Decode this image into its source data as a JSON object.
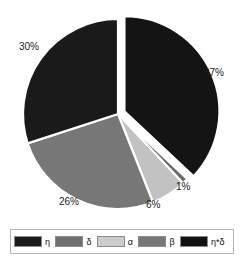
{
  "chart_data": {
    "type": "pie",
    "title": "",
    "categories": [
      "η",
      "β",
      "α",
      "δ",
      "η*δ"
    ],
    "values": [
      37,
      1,
      6,
      26,
      30
    ],
    "value_labels": [
      "37%",
      "1%",
      "6%",
      "26%",
      "30%"
    ],
    "units": "percent",
    "legend_position": "bottom",
    "start_angle_deg": 0,
    "direction": "clockwise",
    "exploded_slices": [
      "η"
    ],
    "slice_colors": [
      "#141414",
      "#6a6a6a",
      "#c2c2c2",
      "#777777",
      "#1a1a1a"
    ],
    "grid": false,
    "xlabel": "",
    "ylabel": ""
  },
  "pie": {
    "slices": [
      {
        "label": "η",
        "percent_text": "37%",
        "value": 37,
        "color": "#141414",
        "exploded": true
      },
      {
        "label": "β",
        "percent_text": "1%",
        "value": 1,
        "color": "#6a6a6a",
        "exploded": false
      },
      {
        "label": "α",
        "percent_text": "6%",
        "value": 6,
        "color": "#c2c2c2",
        "exploded": false
      },
      {
        "label": "δ",
        "percent_text": "26%",
        "value": 26,
        "color": "#777777",
        "exploded": false
      },
      {
        "label": "η*δ",
        "percent_text": "30%",
        "value": 30,
        "color": "#1a1a1a",
        "exploded": false
      }
    ]
  },
  "legend": {
    "items": [
      {
        "label": "η",
        "color": "#1b1b1b"
      },
      {
        "label": "δ",
        "color": "#707070"
      },
      {
        "label": "α",
        "color": "#cccccc"
      },
      {
        "label": "β",
        "color": "#777777"
      },
      {
        "label": "η*δ",
        "color": "#111111"
      }
    ]
  },
  "colors": {
    "background": "#ffffff",
    "text": "#1c1c1c",
    "legend_border": "#b6b6b6",
    "swatch_border": "#8c8c8c"
  }
}
